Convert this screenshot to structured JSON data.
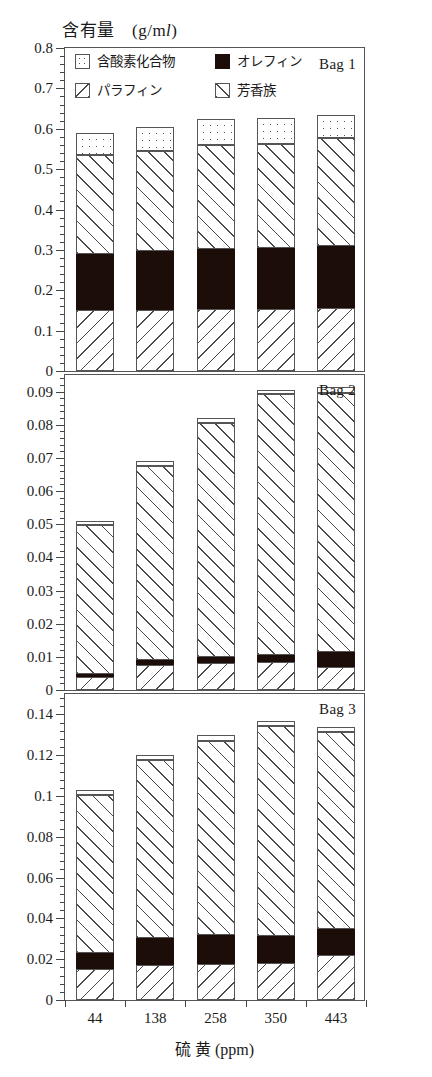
{
  "chart_data": {
    "type": "bar",
    "ylabel": "含有量 (g/ml)",
    "xlabel": "硫 黄 (ppm)",
    "categories": [
      "44",
      "138",
      "258",
      "350",
      "443"
    ],
    "grid": false,
    "legend_position": "top-left-inside-panel-1",
    "stacked": true,
    "series_order": [
      "paraffin",
      "olefin",
      "aromatic",
      "oxygenate"
    ],
    "legend": [
      {
        "key": "oxygenate",
        "label": "含酸素化合物",
        "pattern": "dotted"
      },
      {
        "key": "olefin",
        "label": "オレフィン",
        "pattern": "solid-black"
      },
      {
        "key": "paraffin",
        "label": "パラフィン",
        "pattern": "backslash-hatch"
      },
      {
        "key": "aromatic",
        "label": "芳香族",
        "pattern": "forwardslash-hatch"
      }
    ],
    "panels": [
      {
        "id": "bag1",
        "label": "Bag 1",
        "ylim": [
          0,
          0.8
        ],
        "ytick_step": 0.1,
        "yticks": [
          "0",
          "0.1",
          "0.2",
          "0.3",
          "0.4",
          "0.5",
          "0.6",
          "0.7",
          "0.8"
        ],
        "series": [
          {
            "name": "paraffin",
            "values": [
              0.15,
              0.152,
              0.153,
              0.153,
              0.155
            ]
          },
          {
            "name": "olefin",
            "values": [
              0.14,
              0.145,
              0.148,
              0.152,
              0.155
            ]
          },
          {
            "name": "aromatic",
            "values": [
              0.245,
              0.248,
              0.26,
              0.257,
              0.268
            ]
          },
          {
            "name": "oxygenate",
            "values": [
              0.055,
              0.06,
              0.064,
              0.065,
              0.057
            ]
          }
        ],
        "totals": [
          0.59,
          0.605,
          0.625,
          0.627,
          0.635
        ]
      },
      {
        "id": "bag2",
        "label": "Bag 2",
        "ylim": [
          0,
          0.095
        ],
        "ytick_step": 0.01,
        "yticks": [
          "0",
          "0.01",
          "0.02",
          "0.03",
          "0.04",
          "0.05",
          "0.06",
          "0.07",
          "0.08",
          "0.09"
        ],
        "series": [
          {
            "name": "paraffin",
            "values": [
              0.004,
              0.0075,
              0.0082,
              0.0085,
              0.007
            ]
          },
          {
            "name": "olefin",
            "values": [
              0.0008,
              0.0017,
              0.0017,
              0.0022,
              0.0045
            ]
          },
          {
            "name": "aromatic",
            "values": [
              0.045,
              0.0585,
              0.0705,
              0.0785,
              0.078
            ]
          },
          {
            "name": "oxygenate",
            "values": [
              0.0013,
              0.0013,
              0.0016,
              0.0013,
              0.0018
            ]
          }
        ],
        "totals": [
          0.0511,
          0.069,
          0.082,
          0.0905,
          0.0913
        ]
      },
      {
        "id": "bag3",
        "label": "Bag 3",
        "ylim": [
          0,
          0.15
        ],
        "ytick_step": 0.02,
        "yticks": [
          "0",
          "0.02",
          "0.04",
          "0.06",
          "0.08",
          "0.1",
          "0.12",
          "0.14"
        ],
        "series": [
          {
            "name": "paraffin",
            "values": [
              0.0152,
              0.017,
              0.0175,
              0.018,
              0.0222
            ]
          },
          {
            "name": "olefin",
            "values": [
              0.0078,
              0.0135,
              0.0142,
              0.0135,
              0.0125
            ]
          },
          {
            "name": "aromatic",
            "values": [
              0.0775,
              0.087,
              0.0955,
              0.103,
              0.0965
            ]
          },
          {
            "name": "oxygenate",
            "values": [
              0.0025,
              0.0025,
              0.0028,
              0.0025,
              0.0028
            ]
          }
        ],
        "totals": [
          0.103,
          0.12,
          0.13,
          0.137,
          0.134
        ]
      }
    ]
  }
}
